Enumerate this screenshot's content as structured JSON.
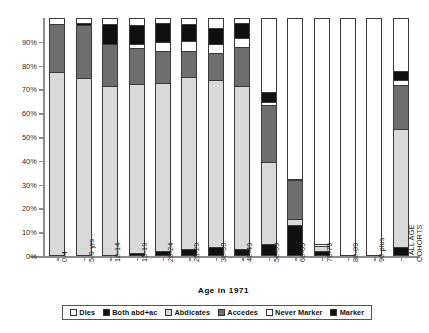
{
  "chart_data": {
    "type": "bar",
    "subtype": "stacked-percentage",
    "title": "",
    "xlabel": "Age in 1971",
    "ylabel": "",
    "ylim": [
      0,
      100
    ],
    "yticks": [
      "0%",
      "10%",
      "20%",
      "30%",
      "40%",
      "50%",
      "60%",
      "70%",
      "80%",
      "90%"
    ],
    "ytick_values": [
      0,
      10,
      20,
      30,
      40,
      50,
      60,
      70,
      80,
      90
    ],
    "grid": false,
    "legend_position": "bottom",
    "categories": [
      "0-4",
      "5-9 yrs",
      "10-14",
      "15-19",
      "20-24",
      "25-29",
      "30-39",
      "40-49",
      "50-59",
      "60-69",
      "70-79",
      "80-89",
      "90 plus",
      "ALL AGE COHORTS"
    ],
    "series": [
      {
        "name": "Dies",
        "swatch": "white",
        "values": [
          0,
          0,
          0,
          0,
          0,
          0,
          0,
          0,
          0,
          0,
          0,
          0,
          0,
          0
        ]
      },
      {
        "name": "Both abd+ac",
        "swatch": "black",
        "values": [
          0,
          0,
          0,
          0.8,
          1.8,
          2.6,
          3.5,
          2.6,
          4.5,
          12.5,
          1.5,
          0,
          0,
          3.5
        ]
      },
      {
        "name": "Abdicates",
        "swatch": "lgray",
        "values": [
          77,
          74.5,
          71,
          71,
          70.5,
          72,
          70,
          68.5,
          34.5,
          2.5,
          2.5,
          0,
          0,
          49.5
        ]
      },
      {
        "name": "Accedes",
        "swatch": "dgray",
        "values": [
          20,
          22,
          17.5,
          15,
          13.5,
          11,
          11.5,
          16.5,
          24,
          16.5,
          0,
          0,
          0,
          18.5
        ]
      },
      {
        "name": "Never Marker",
        "swatch": "white",
        "values": [
          0,
          0,
          0,
          2,
          3.5,
          4.5,
          3.5,
          3.5,
          1.5,
          0,
          0,
          0,
          0,
          2
        ]
      },
      {
        "name": "Marker",
        "swatch": "black",
        "values": [
          0,
          1,
          8.5,
          8,
          8,
          7,
          7,
          6.5,
          4,
          0.5,
          0.5,
          0,
          0,
          4
        ]
      }
    ],
    "totals": [
      97,
      97.5,
      97,
      96.8,
      97.3,
      97.1,
      95.5,
      97.6,
      68.5,
      32,
      4.5,
      0,
      0,
      77.5
    ]
  },
  "legend": {
    "items": [
      {
        "label": "Dies",
        "swatch": "white"
      },
      {
        "label": "Both abd+ac",
        "swatch": "black"
      },
      {
        "label": "Abdicates",
        "swatch": "lgray"
      },
      {
        "label": "Accedes",
        "swatch": "dgray"
      },
      {
        "label": "Never Marker",
        "swatch": "white"
      },
      {
        "label": "Marker",
        "swatch": "black"
      }
    ]
  }
}
